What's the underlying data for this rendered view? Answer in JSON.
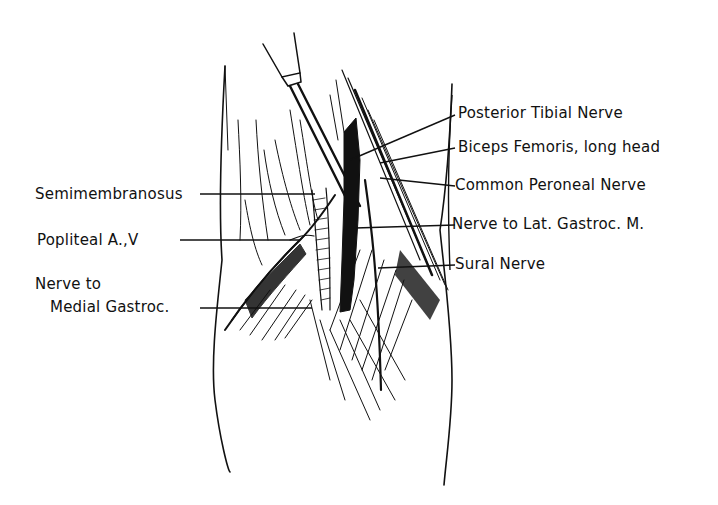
{
  "figure": {
    "labels_right": [
      {
        "id": "posterior-tibial-nerve",
        "text": "Posterior Tibial Nerve"
      },
      {
        "id": "biceps-femoris-long-head",
        "text": "Biceps Femoris, long head"
      },
      {
        "id": "common-peroneal-nerve",
        "text": "Common Peroneal Nerve"
      },
      {
        "id": "nerve-to-lat-gastroc",
        "text": "Nerve to Lat. Gastroc. M."
      },
      {
        "id": "sural-nerve",
        "text": "Sural Nerve"
      }
    ],
    "labels_left": [
      {
        "id": "semimembranosus",
        "text": "Semimembranosus"
      },
      {
        "id": "popliteal-av",
        "text": "Popliteal A.,V"
      },
      {
        "id": "nerve-to-medial-gastroc-line1",
        "text": "Nerve to"
      },
      {
        "id": "nerve-to-medial-gastroc-line2",
        "text": "Medial Gastroc."
      }
    ],
    "colors": {
      "ink": "#111111",
      "background": "#ffffff"
    }
  }
}
